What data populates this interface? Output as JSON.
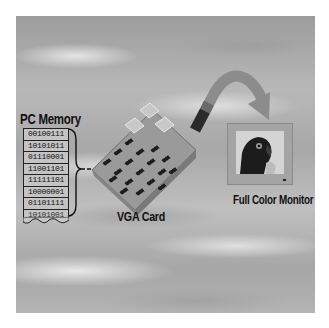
{
  "diagram": {
    "labels": {
      "pc_memory": "PC Memory",
      "vga_card": "VGA Card",
      "monitor": "Full Color Monitor"
    },
    "memory_rows": [
      "00100111",
      "10101011",
      "01110001",
      "11001101",
      "11111101",
      "10000001",
      "01101111",
      "10101001"
    ],
    "nodes": [
      {
        "id": "pc-memory",
        "label": "PC Memory",
        "icon": "memory-stack-icon"
      },
      {
        "id": "vga-card",
        "label": "VGA Card",
        "icon": "circuit-board-icon"
      },
      {
        "id": "monitor",
        "label": "Full Color Monitor",
        "icon": "monitor-icon"
      }
    ],
    "edges": [
      {
        "from": "pc-memory",
        "to": "vga-card",
        "style": "dashed brace connector"
      },
      {
        "from": "vga-card",
        "to": "monitor",
        "style": "curved arrow"
      }
    ],
    "colors": {
      "background": "#ffffff",
      "sky": "#ababab",
      "text": "#111111",
      "card": "#8e8e8e",
      "chip": "#1e1e1e",
      "monitor_frame": "#a4a4a4"
    }
  }
}
